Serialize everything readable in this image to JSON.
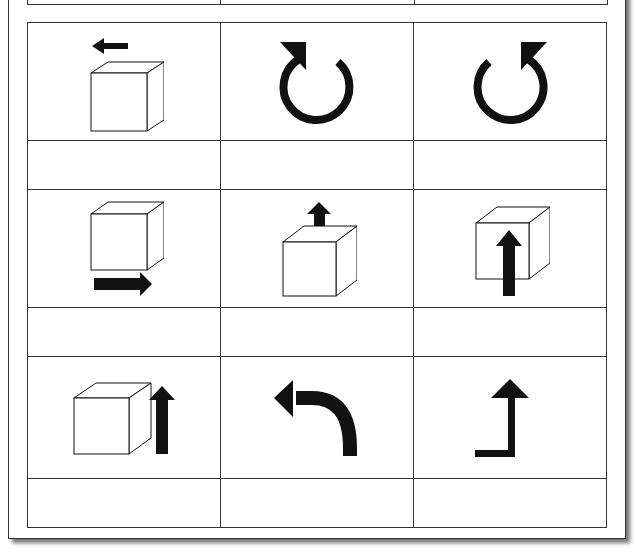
{
  "document": {
    "type": "worksheet-grid",
    "columns": 3,
    "rows": [
      {
        "cells": [
          {
            "icon": "cube-with-left-arrow-icon",
            "answer": ""
          },
          {
            "icon": "rotate-clockwise-icon",
            "answer": ""
          },
          {
            "icon": "rotate-counterclockwise-icon",
            "answer": ""
          }
        ]
      },
      {
        "cells": [
          {
            "icon": "cube-with-right-arrow-below-icon",
            "answer": ""
          },
          {
            "icon": "cube-with-up-arrow-on-top-icon",
            "answer": ""
          },
          {
            "icon": "cube-with-up-arrow-through-front-icon",
            "answer": ""
          }
        ]
      },
      {
        "cells": [
          {
            "icon": "cube-with-up-arrow-beside-icon",
            "answer": ""
          },
          {
            "icon": "turn-left-arrow-icon",
            "answer": ""
          },
          {
            "icon": "corner-up-arrow-icon",
            "answer": ""
          }
        ]
      }
    ],
    "colors": {
      "ink": "#111111",
      "line": "#333333",
      "paper": "#ffffff"
    }
  }
}
